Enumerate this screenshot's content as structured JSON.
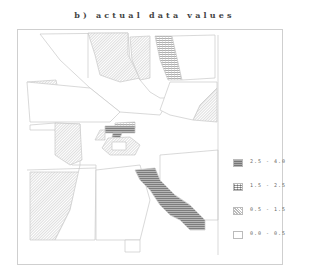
{
  "title": "b) actual data values",
  "legend": {
    "items": [
      {
        "label": "2.5 - 4.0",
        "pattern": "dense-horizontal"
      },
      {
        "label": "1.5 - 2.5",
        "pattern": "horizontal-grid"
      },
      {
        "label": "0.5 - 1.5",
        "pattern": "diagonal-hatch"
      },
      {
        "label": "0.0 - 0.5",
        "pattern": "blank"
      }
    ]
  },
  "colors": {
    "outline": "#c8c8c8",
    "class_high": "#8a8a8a",
    "class_midhigh": "#b0b0b0",
    "class_mid": "#c8c8c8",
    "class_low": "#ffffff"
  }
}
